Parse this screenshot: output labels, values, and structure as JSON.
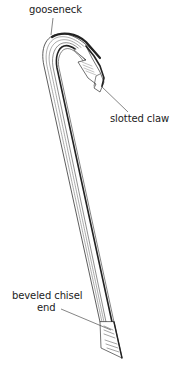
{
  "figure": {
    "labels": {
      "gooseneck": "gooseneck",
      "slotted_claw": "slotted claw",
      "beveled_chisel_end_line1": "beveled chisel",
      "beveled_chisel_end_line2": "end"
    },
    "colors": {
      "ink": "#222222",
      "shading": "#555555",
      "background": "#ffffff"
    }
  }
}
